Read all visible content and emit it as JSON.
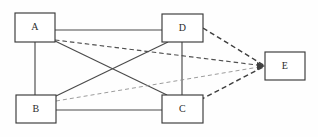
{
  "diagram": {
    "canvas": {
      "width": 318,
      "height": 137,
      "background": "#fefefe"
    },
    "colors": {
      "node_stroke": "#3a3a3a",
      "node_fill": "#ffffff",
      "label_color": "#2b2b2b",
      "edge_solid": "#4a4a4a",
      "edge_dashed_heavy": "#3f3f3f",
      "edge_dashed_medium": "#4f4f4f",
      "edge_dashed_light": "#8a8a8a"
    },
    "nodes": [
      {
        "id": "A",
        "label": "A",
        "x": 15,
        "y": 13,
        "w": 40,
        "h": 29
      },
      {
        "id": "D",
        "label": "D",
        "x": 162,
        "y": 14,
        "w": 41,
        "h": 28
      },
      {
        "id": "E",
        "label": "E",
        "x": 265,
        "y": 52,
        "w": 40,
        "h": 28
      },
      {
        "id": "B",
        "label": "B",
        "x": 16,
        "y": 95,
        "w": 40,
        "h": 28
      },
      {
        "id": "C",
        "label": "C",
        "x": 162,
        "y": 95,
        "w": 41,
        "h": 28
      }
    ],
    "edges": [
      {
        "id": "A-D",
        "from": "A",
        "to": "D",
        "style": "solid",
        "x1": 55,
        "y1": 30,
        "x2": 162,
        "y2": 30
      },
      {
        "id": "A-B",
        "from": "A",
        "to": "B",
        "style": "solid",
        "x1": 35,
        "y1": 42,
        "x2": 35,
        "y2": 95
      },
      {
        "id": "A-C",
        "from": "A",
        "to": "C",
        "style": "solid",
        "x1": 55,
        "y1": 41,
        "x2": 167,
        "y2": 95
      },
      {
        "id": "B-D",
        "from": "B",
        "to": "D",
        "style": "solid",
        "x1": 56,
        "y1": 96,
        "x2": 168,
        "y2": 42
      },
      {
        "id": "B-C",
        "from": "B",
        "to": "C",
        "style": "solid",
        "x1": 56,
        "y1": 110,
        "x2": 162,
        "y2": 110
      },
      {
        "id": "D-C",
        "from": "D",
        "to": "C",
        "style": "solid",
        "x1": 182,
        "y1": 42,
        "x2": 182,
        "y2": 95
      },
      {
        "id": "D-E",
        "from": "D",
        "to": "E",
        "style": "dashed-heavy",
        "x1": 203,
        "y1": 28,
        "x2": 265,
        "y2": 66
      },
      {
        "id": "A-E",
        "from": "A",
        "to": "E",
        "style": "dashed-medium",
        "x1": 55,
        "y1": 40,
        "x2": 265,
        "y2": 66
      },
      {
        "id": "B-E",
        "from": "B",
        "to": "E",
        "style": "dashed-light",
        "x1": 56,
        "y1": 101,
        "x2": 265,
        "y2": 66
      },
      {
        "id": "C-E",
        "from": "C",
        "to": "E",
        "style": "dashed-heavy",
        "x1": 200,
        "y1": 100,
        "x2": 265,
        "y2": 66
      }
    ]
  }
}
